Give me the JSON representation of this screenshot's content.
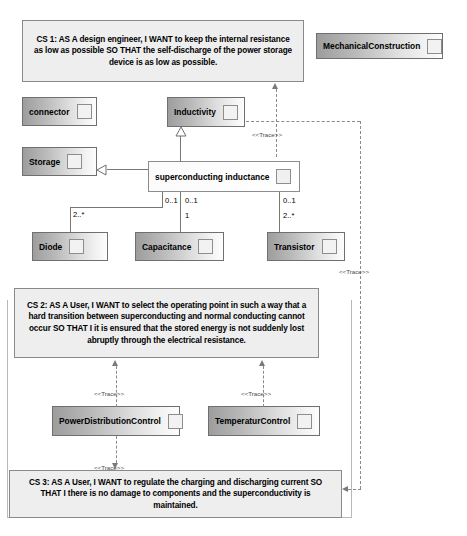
{
  "diagram": {
    "type": "uml-sysml-requirements-diagram"
  },
  "requirements": [
    {
      "id": "cs1",
      "name": "CS 1",
      "text": "CS 1: AS A design engineer, I WANT to keep the internal resistance as low as possible SO THAT the self-discharge of the power storage device is as low as possible."
    },
    {
      "id": "cs2",
      "name": "CS 2",
      "text": "CS 2: AS A User, I WANT to select the operating point in such a way that a hard transition between superconducting and normal conducting cannot occur SO THAT I it is ensured that the stored energy is not suddenly lost abruptly through the electrical resistance."
    },
    {
      "id": "cs3",
      "name": "CS 3",
      "text": "CS 3: AS A User, I WANT to regulate the charging and discharging current  SO THAT I there is no damage to components and the superconductivity is maintained."
    }
  ],
  "blocks": [
    {
      "id": "mechanical_construction",
      "label": "MechanicalConstruction"
    },
    {
      "id": "connector",
      "label": "connector"
    },
    {
      "id": "inductivity",
      "label": "Inductivity"
    },
    {
      "id": "storage",
      "label": "Storage"
    },
    {
      "id": "superconducting_inductance",
      "label": "superconducting inductance"
    },
    {
      "id": "diode",
      "label": "Diode"
    },
    {
      "id": "capacitance",
      "label": "Capacitance"
    },
    {
      "id": "transistor",
      "label": "Transistor"
    },
    {
      "id": "power_distribution_control",
      "label": "PowerDistributionControl"
    },
    {
      "id": "temperatur_control",
      "label": "TemperaturControl"
    }
  ],
  "multiplicities": {
    "diode_end": "2..*",
    "sc_left": "0..1",
    "capacitance_upper": "0..1",
    "capacitance_lower": "1",
    "transistor_upper": "0..1",
    "transistor_lower": "2..*"
  },
  "stereotypes": {
    "trace": "<<Trace>>"
  },
  "colors": {
    "background": "#ffffff",
    "requirement_fill": "#eeeeee",
    "requirement_border": "#8a8a8a",
    "block_border": "#6f6f6f",
    "connector_line": "#777777",
    "text": "#000000"
  }
}
